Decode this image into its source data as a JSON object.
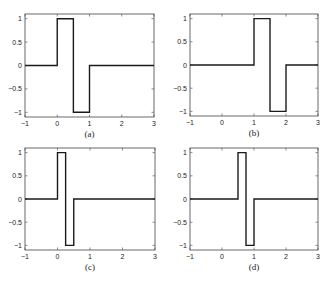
{
  "chart_data": [
    {
      "type": "line",
      "caption": "(a)",
      "title": "",
      "xlabel": "",
      "ylabel": "",
      "xlim": [
        -1,
        3
      ],
      "ylim": [
        -1.1,
        1.1
      ],
      "xticks": [
        -1,
        0,
        1,
        2,
        3
      ],
      "yticks": [
        -1,
        -0.5,
        0,
        0.5,
        1
      ],
      "ytick_labels": [
        "-1",
        "-0.5",
        "0",
        "0.5",
        "1"
      ],
      "grid": false,
      "x": [
        -1,
        0,
        0,
        0.5,
        0.5,
        1,
        1,
        3
      ],
      "y": [
        0,
        0,
        1,
        1,
        -1,
        -1,
        0,
        0
      ]
    },
    {
      "type": "line",
      "caption": "(b)",
      "title": "",
      "xlabel": "",
      "ylabel": "",
      "xlim": [
        -1,
        3
      ],
      "ylim": [
        -1.1,
        1.1
      ],
      "xticks": [
        -1,
        0,
        1,
        2,
        3
      ],
      "yticks": [
        -1,
        -0.5,
        0,
        0.5,
        1
      ],
      "ytick_labels": [
        "-1",
        "-0.5",
        "0",
        "0.5",
        "1"
      ],
      "grid": false,
      "x": [
        -1,
        1,
        1,
        1.5,
        1.5,
        2,
        2,
        3
      ],
      "y": [
        0,
        0,
        1,
        1,
        -1,
        -1,
        0,
        0
      ]
    },
    {
      "type": "line",
      "caption": "(c)",
      "title": "",
      "xlabel": "",
      "ylabel": "",
      "xlim": [
        -1,
        3
      ],
      "ylim": [
        -1.1,
        1.1
      ],
      "xticks": [
        -1,
        0,
        1,
        2,
        3
      ],
      "yticks": [
        -1,
        -0.5,
        0,
        0.5,
        1
      ],
      "ytick_labels": [
        "-1",
        "-0.5",
        "0",
        "0.5",
        "1"
      ],
      "grid": false,
      "x": [
        -1,
        0,
        0,
        0.25,
        0.25,
        0.5,
        0.5,
        3
      ],
      "y": [
        0,
        0,
        1,
        1,
        -1,
        -1,
        0,
        0
      ]
    },
    {
      "type": "line",
      "caption": "(d)",
      "title": "",
      "xlabel": "",
      "ylabel": "",
      "xlim": [
        -1,
        3
      ],
      "ylim": [
        -1.1,
        1.1
      ],
      "xticks": [
        -1,
        0,
        1,
        2,
        3
      ],
      "yticks": [
        -1,
        -0.5,
        0,
        0.5,
        1
      ],
      "ytick_labels": [
        "-1",
        "-0.5",
        "0",
        "0.5",
        "1"
      ],
      "grid": false,
      "x": [
        -1,
        0.5,
        0.5,
        0.75,
        0.75,
        1,
        1,
        3
      ],
      "y": [
        0,
        0,
        1,
        1,
        -1,
        -1,
        0,
        0
      ]
    }
  ],
  "layout": {
    "panels": [
      {
        "left": 25,
        "top": 14,
        "right": 154,
        "bottom": 117
      },
      {
        "left": 190,
        "top": 14,
        "right": 318,
        "bottom": 116
      },
      {
        "left": 25,
        "top": 148,
        "right": 155,
        "bottom": 250
      },
      {
        "left": 190,
        "top": 148,
        "right": 318,
        "bottom": 250
      }
    ],
    "line_color": "#1a1a1a",
    "axis_color": "#444444"
  }
}
